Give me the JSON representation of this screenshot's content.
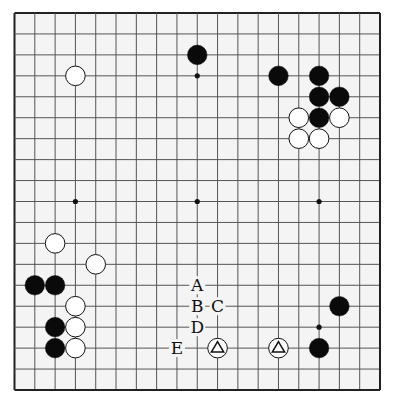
{
  "board": {
    "size": 19,
    "left": 14.5,
    "top": 13,
    "right": 380,
    "bottom": 390,
    "background": "#f4f4f4",
    "line_color": "#555555",
    "edge_color": "#222222",
    "star_points": [
      [
        3,
        3
      ],
      [
        9,
        3
      ],
      [
        15,
        3
      ],
      [
        3,
        9
      ],
      [
        9,
        9
      ],
      [
        15,
        9
      ],
      [
        3,
        15
      ],
      [
        9,
        15
      ],
      [
        15,
        15
      ]
    ]
  },
  "stones": [
    {
      "color": "black",
      "col": 9,
      "row": 2
    },
    {
      "color": "white",
      "col": 3,
      "row": 3
    },
    {
      "color": "black",
      "col": 13,
      "row": 3
    },
    {
      "color": "black",
      "col": 15,
      "row": 3
    },
    {
      "color": "black",
      "col": 15,
      "row": 4
    },
    {
      "color": "black",
      "col": 16,
      "row": 4
    },
    {
      "color": "white",
      "col": 14,
      "row": 5
    },
    {
      "color": "black",
      "col": 15,
      "row": 5
    },
    {
      "color": "white",
      "col": 16,
      "row": 5
    },
    {
      "color": "white",
      "col": 14,
      "row": 6
    },
    {
      "color": "white",
      "col": 15,
      "row": 6
    },
    {
      "color": "white",
      "col": 2,
      "row": 11
    },
    {
      "color": "white",
      "col": 4,
      "row": 12
    },
    {
      "color": "black",
      "col": 1,
      "row": 13
    },
    {
      "color": "black",
      "col": 2,
      "row": 13
    },
    {
      "color": "white",
      "col": 3,
      "row": 14
    },
    {
      "color": "black",
      "col": 2,
      "row": 15
    },
    {
      "color": "white",
      "col": 3,
      "row": 15
    },
    {
      "color": "black",
      "col": 2,
      "row": 16
    },
    {
      "color": "white",
      "col": 3,
      "row": 16
    },
    {
      "color": "white",
      "col": 10,
      "row": 16,
      "mark": "triangle"
    },
    {
      "color": "white",
      "col": 13,
      "row": 16,
      "mark": "triangle"
    },
    {
      "color": "black",
      "col": 16,
      "row": 14
    },
    {
      "color": "black",
      "col": 15,
      "row": 16
    }
  ],
  "labels": [
    {
      "text": "A",
      "col": 9,
      "row": 13
    },
    {
      "text": "B",
      "col": 9,
      "row": 14
    },
    {
      "text": "C",
      "col": 10,
      "row": 14
    },
    {
      "text": "D",
      "col": 9,
      "row": 15
    },
    {
      "text": "E",
      "col": 8,
      "row": 16
    }
  ]
}
